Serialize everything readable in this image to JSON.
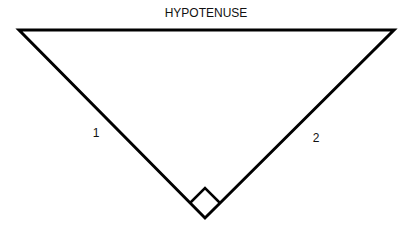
{
  "diagram": {
    "labels": {
      "hypotenuse": "HYPOTENUSE",
      "leg1": "1",
      "leg2": "2"
    },
    "vertices": {
      "top_left": [
        19,
        30
      ],
      "top_right": [
        394,
        30
      ],
      "right_angle": [
        205,
        218
      ]
    },
    "right_angle_marker": {
      "top": [
        205,
        188
      ],
      "left": [
        190,
        203
      ],
      "right": [
        220,
        203
      ],
      "bottom": [
        205,
        218
      ]
    },
    "colors": {
      "stroke": "#000000",
      "background": "#ffffff",
      "text": "#111111"
    }
  }
}
